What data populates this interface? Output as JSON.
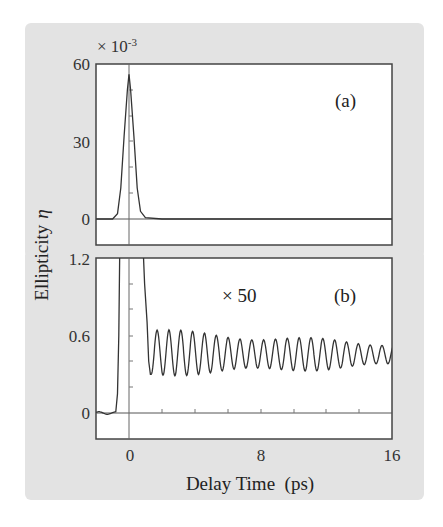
{
  "figure": {
    "ylabel": "Ellipticity",
    "ylabel_symbol": "η",
    "xlabel": "Delay Time  (ps)",
    "background": "#e3e3e3"
  },
  "panel_a": {
    "label": "(a)",
    "scale_note": "× 10",
    "scale_exp": "-3",
    "yticks": [
      "60",
      "30",
      "0"
    ]
  },
  "panel_b": {
    "label": "(b)",
    "multiplier": "× 50",
    "yticks": [
      "1.2",
      "0.6",
      "0"
    ],
    "xticks": [
      "0",
      "8",
      "16"
    ]
  },
  "chart_data": [
    {
      "type": "line",
      "title": "(a)",
      "xlabel": "Delay Time (ps)",
      "ylabel": "Ellipticity η (×10^-3)",
      "xlim": [
        -2,
        16
      ],
      "ylim": [
        -11,
        60
      ],
      "yticks": [
        0,
        30,
        60
      ],
      "grid": false,
      "series": [
        {
          "name": "ellipticity",
          "x": [
            -2,
            -1.0,
            -0.7,
            -0.5,
            -0.3,
            -0.1,
            0,
            0.1,
            0.3,
            0.5,
            0.7,
            1.0,
            2,
            4,
            8,
            12,
            16
          ],
          "y": [
            0,
            0,
            2,
            12,
            32,
            50,
            56,
            50,
            32,
            12,
            3,
            0.5,
            0,
            0,
            0,
            0,
            0
          ]
        }
      ]
    },
    {
      "type": "line",
      "title": "(b)",
      "annotation": "× 50",
      "xlabel": "Delay Time (ps)",
      "ylabel": "Ellipticity η (×10^-3, ×50)",
      "xlim": [
        -2,
        16
      ],
      "ylim": [
        -0.2,
        1.2
      ],
      "xticks": [
        0,
        8,
        16
      ],
      "yticks": [
        0,
        0.6,
        1.2
      ],
      "grid": false,
      "series": [
        {
          "name": "ellipticity ×50",
          "description": "Rises sharply near -0.7 ps (off scale), falls at ~1 ps, then damped oscillation with period ≈0.7 ps centered ≈0.45, peaks ≈0.62 → ≈0.52, troughs ≈0.28 → ≈0.40 by 16 ps",
          "x": [
            -2,
            -1.5,
            -1.0,
            -0.7,
            -0.55,
            0.9,
            1.2,
            1.35,
            1.7,
            2.05,
            2.4,
            2.75,
            3.1,
            3.45,
            3.8,
            4.15,
            4.5,
            4.85,
            5.2,
            6.6,
            8.0,
            10.0,
            12.0,
            14.0,
            16.0
          ],
          "y": [
            0.0,
            0.01,
            -0.01,
            0.2,
            1.2,
            1.2,
            0.6,
            0.3,
            0.6,
            0.25,
            0.6,
            0.26,
            0.6,
            0.28,
            0.65,
            0.3,
            0.62,
            0.3,
            0.63,
            0.6,
            0.58,
            0.56,
            0.52,
            0.5,
            0.52
          ]
        }
      ]
    }
  ]
}
